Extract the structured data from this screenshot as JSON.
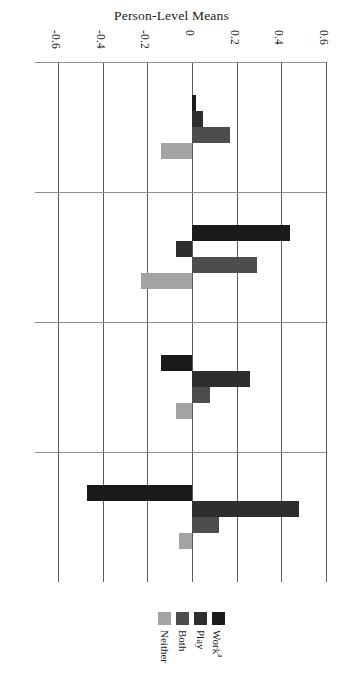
{
  "chart_data": {
    "type": "bar",
    "orientation": "horizontal",
    "title": "Person-Level Means",
    "xlabel": "",
    "ylabel": "",
    "xlim": [
      -0.6,
      0.6
    ],
    "xticks": [
      -0.6,
      -0.4,
      -0.2,
      0,
      0.2,
      0.4,
      0.6
    ],
    "xticklabels": [
      "-0.6",
      "-0.4",
      "-0.2",
      "0",
      "0.2",
      "0.4",
      "0.6"
    ],
    "grid": true,
    "legend_position": "bottom",
    "categories": [
      "Self Esteem",
      "Salience",
      "Positive Affect",
      "Enjoyment"
    ],
    "series": [
      {
        "name": "Work",
        "name_sup": "a",
        "color": "#1a1a1a",
        "values": [
          0.02,
          0.44,
          -0.14,
          -0.47
        ]
      },
      {
        "name": "Play",
        "name_sup": "",
        "color": "#2e2e2e",
        "values": [
          0.05,
          -0.07,
          0.26,
          0.48
        ]
      },
      {
        "name": "Both",
        "name_sup": "",
        "color": "#4d4d4d",
        "values": [
          0.17,
          0.29,
          0.08,
          0.12
        ]
      },
      {
        "name": "Neither",
        "name_sup": "",
        "color": "#a3a3a3",
        "values": [
          -0.14,
          -0.23,
          -0.07,
          -0.06
        ]
      }
    ],
    "legend_entries": [
      "Neither",
      "Both",
      "Play",
      "Work"
    ],
    "colors": {
      "work": "#1a1a1a",
      "play": "#2e2e2e",
      "both": "#4d4d4d",
      "neither": "#a3a3a3",
      "gridline": "#555f63",
      "separator": "#8d9194",
      "text": "#1a1a1a",
      "background": "#ffffff"
    }
  }
}
